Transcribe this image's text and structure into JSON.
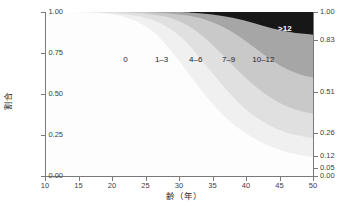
{
  "chart_data": {
    "type": "area",
    "title": "",
    "xlabel": "齢（年）",
    "ylabel": "割合",
    "xlim": [
      10,
      50
    ],
    "ylim": [
      0.0,
      1.0
    ],
    "grid": false,
    "legend_position": "inline-labels",
    "x_ticks": [
      "10",
      "15",
      "20",
      "25",
      "30",
      "35",
      "40",
      "45",
      "50"
    ],
    "x_tick_values": [
      10,
      15,
      20,
      25,
      30,
      35,
      40,
      45,
      50
    ],
    "y_ticks_left": [
      "0.00",
      "0.25",
      "0.50",
      "0.75",
      "1.00"
    ],
    "y_tick_values_left": [
      0.0,
      0.25,
      0.5,
      0.75,
      1.0
    ],
    "y_ticks_right": [
      "0.00",
      "0.05",
      "0.12",
      "0.26",
      "0.51",
      "0.83",
      "1.00"
    ],
    "y_tick_values_right": [
      0.0,
      0.05,
      0.12,
      0.26,
      0.51,
      0.83,
      1.0
    ],
    "right_axis_note": "cumulative band boundaries at x = 50",
    "series": [
      {
        "name": "0",
        "label": "0",
        "color": "#fdfdfd",
        "boundary_top": [
          [
            10,
            1.0
          ],
          [
            14,
            1.0
          ],
          [
            17,
            0.995
          ],
          [
            20,
            0.985
          ],
          [
            23,
            0.955
          ],
          [
            26,
            0.885
          ],
          [
            29,
            0.755
          ],
          [
            32,
            0.595
          ],
          [
            35,
            0.44
          ],
          [
            38,
            0.32
          ],
          [
            41,
            0.235
          ],
          [
            44,
            0.175
          ],
          [
            47,
            0.135
          ],
          [
            50,
            0.115
          ]
        ]
      },
      {
        "name": "1-3",
        "label": "1–3",
        "color": "#f0f0f0",
        "boundary_top": [
          [
            10,
            1.0
          ],
          [
            16,
            1.0
          ],
          [
            19,
            0.995
          ],
          [
            22,
            0.985
          ],
          [
            25,
            0.965
          ],
          [
            28,
            0.915
          ],
          [
            31,
            0.82
          ],
          [
            34,
            0.675
          ],
          [
            37,
            0.53
          ],
          [
            40,
            0.405
          ],
          [
            43,
            0.32
          ],
          [
            46,
            0.265
          ],
          [
            50,
            0.23
          ]
        ]
      },
      {
        "name": "4-6",
        "label": "4–6",
        "color": "#e0e0e0",
        "boundary_top": [
          [
            10,
            1.0
          ],
          [
            20,
            1.0
          ],
          [
            23,
            0.995
          ],
          [
            26,
            0.985
          ],
          [
            29,
            0.96
          ],
          [
            32,
            0.9
          ],
          [
            35,
            0.8
          ],
          [
            38,
            0.675
          ],
          [
            41,
            0.56
          ],
          [
            44,
            0.47
          ],
          [
            47,
            0.41
          ],
          [
            50,
            0.38
          ]
        ]
      },
      {
        "name": "7-9",
        "label": "7–9",
        "color": "#c9c9c9",
        "boundary_top": [
          [
            10,
            1.0
          ],
          [
            24,
            1.0
          ],
          [
            27,
            0.995
          ],
          [
            30,
            0.985
          ],
          [
            33,
            0.965
          ],
          [
            36,
            0.92
          ],
          [
            39,
            0.85
          ],
          [
            42,
            0.76
          ],
          [
            45,
            0.675
          ],
          [
            48,
            0.62
          ],
          [
            50,
            0.6
          ]
        ]
      },
      {
        "name": "10-12",
        "label": "10–12",
        "color": "#a6a6a6",
        "boundary_top": [
          [
            10,
            1.0
          ],
          [
            29,
            1.0
          ],
          [
            32,
            0.995
          ],
          [
            35,
            0.985
          ],
          [
            38,
            0.965
          ],
          [
            41,
            0.935
          ],
          [
            44,
            0.9
          ],
          [
            47,
            0.875
          ],
          [
            50,
            0.862
          ]
        ]
      },
      {
        "name": ">12",
        "label": ">12",
        "color": "#171717",
        "boundary_top": [
          [
            10,
            1.0
          ],
          [
            50,
            1.0
          ]
        ]
      }
    ],
    "band_labels": [
      {
        "text": "0",
        "x": 22.0,
        "y": 0.715,
        "style": "dark"
      },
      {
        "text": "1–3",
        "x": 27.4,
        "y": 0.715,
        "style": "dark"
      },
      {
        "text": "4–6",
        "x": 32.5,
        "y": 0.715,
        "style": "dark"
      },
      {
        "text": "7–9",
        "x": 37.4,
        "y": 0.715,
        "style": "dark"
      },
      {
        "text": "10–12",
        "x": 42.6,
        "y": 0.715,
        "style": "dark"
      },
      {
        "text": ">12",
        "x": 45.8,
        "y": 0.905,
        "style": "light"
      }
    ]
  }
}
